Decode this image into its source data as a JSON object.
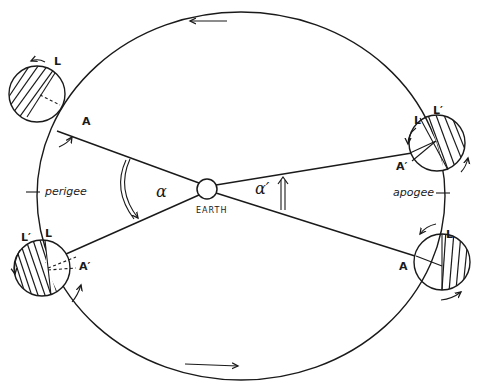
{
  "diagram": {
    "type": "lunar-orbit-libration",
    "labels": {
      "earth": "EARTH",
      "perigee": "perigee",
      "apogee": "apogee",
      "alpha": "α",
      "alpha_prime": "α′"
    },
    "moons": [
      {
        "id": "upper-left",
        "marker_L": "L",
        "marker_A": "A"
      },
      {
        "id": "lower-left",
        "marker_L": "L",
        "marker_L_prime": "L′",
        "marker_A_prime": "A′"
      },
      {
        "id": "upper-right",
        "marker_L": "L",
        "marker_L_prime": "L′",
        "marker_A_prime": "A′"
      },
      {
        "id": "lower-right",
        "marker_L": "L",
        "marker_A": "A"
      }
    ],
    "orbit_direction": "counter-clockwise",
    "colors": {
      "ink": "#1a1a1a",
      "background": "#ffffff"
    }
  }
}
